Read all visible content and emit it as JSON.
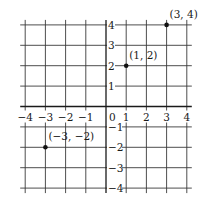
{
  "chart_data": {
    "type": "scatter",
    "title": "",
    "xlabel": "",
    "ylabel": "",
    "xlim": [
      -4,
      4
    ],
    "ylim": [
      -4,
      4
    ],
    "grid": true,
    "x_ticks": [
      -4,
      -3,
      -2,
      -1,
      0,
      1,
      2,
      3,
      4
    ],
    "y_ticks": [
      4,
      3,
      2,
      1,
      -1,
      -2,
      -3,
      -4
    ],
    "x_tick_labels": [
      "−4",
      "−3",
      "−2",
      "−1",
      "0",
      "1",
      "2",
      "3",
      "4"
    ],
    "y_tick_labels": [
      "4",
      "3",
      "2",
      "1",
      "−1",
      "−2",
      "−3",
      "−4"
    ],
    "points": [
      {
        "x": 3,
        "y": 4,
        "label": "(3, 4)"
      },
      {
        "x": 1,
        "y": 2,
        "label": "(1, 2)"
      },
      {
        "x": -3,
        "y": -2,
        "label": "(−3, −2)"
      }
    ]
  },
  "colors": {
    "grid": "#3a3a3a",
    "axis": "#1a1a1a",
    "point": "#111111",
    "background": "#ffffff"
  }
}
